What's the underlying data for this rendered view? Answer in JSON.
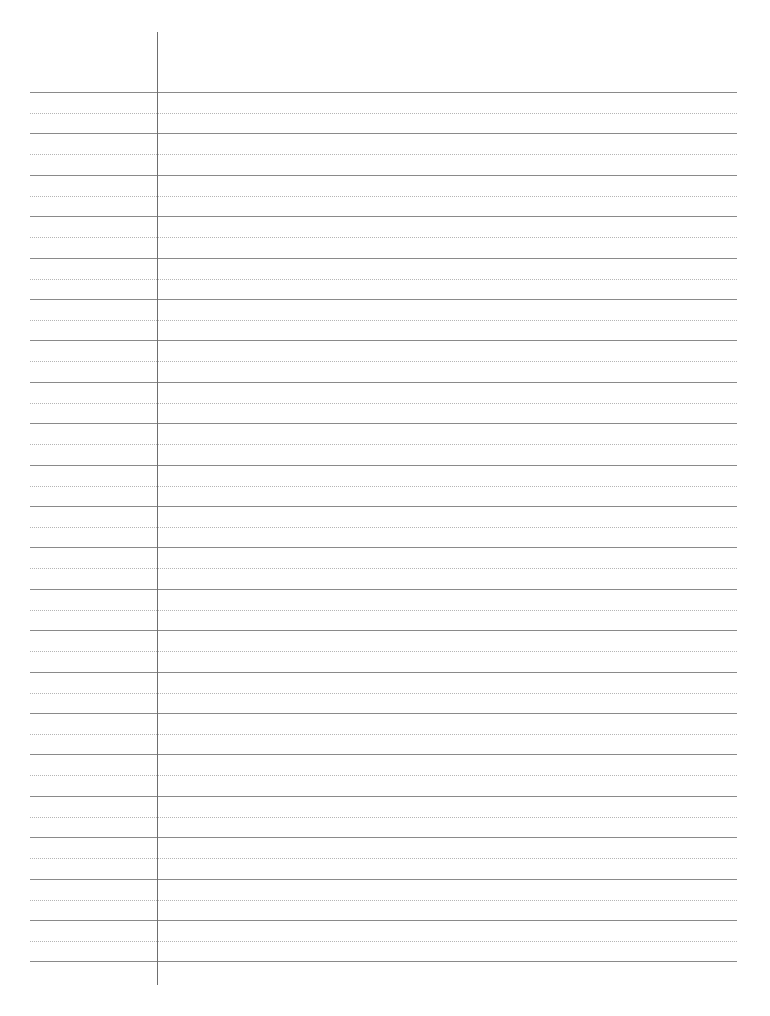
{
  "page": {
    "type": "lined-paper",
    "solid_line_count": 22,
    "dotted_line_count": 21,
    "first_line_y": 92,
    "line_spacing": 41.4,
    "line_left": 30,
    "line_right": 737,
    "margin_x": 157,
    "margin_top": 32,
    "margin_bottom": 985,
    "colors": {
      "solid_line": "#8a8a8a",
      "dotted_line": "#b5b5b5",
      "margin_line": "#6e6e6e",
      "background": "#ffffff"
    }
  }
}
